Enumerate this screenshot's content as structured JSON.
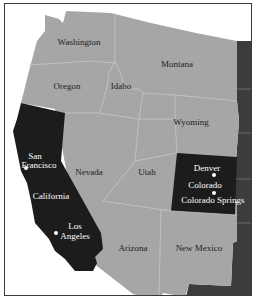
{
  "map": {
    "colors": {
      "background": "#ffffff",
      "state_default": "#a6a6a6",
      "state_highlight": "#1c1c1c",
      "state_east": "#3c3c3c",
      "border": "#c8c8c8",
      "frame": "#3a3a3a"
    },
    "highlighted_states": [
      "California",
      "Colorado"
    ],
    "states": {
      "washington": "Washington",
      "oregon": "Oregon",
      "idaho": "Idaho",
      "montana": "Montana",
      "wyoming": "Wyoming",
      "california": "California",
      "nevada": "Nevada",
      "utah": "Utah",
      "colorado": "Colorado",
      "arizona": "Arizona",
      "new_mexico": "New Mexico"
    },
    "cities": {
      "san_francisco_line1": "San",
      "san_francisco_line2": "Francisco",
      "los_angeles_line1": "Los",
      "los_angeles_line2": "Angeles",
      "denver": "Denver",
      "colorado_springs": "Colorado Springs"
    }
  }
}
